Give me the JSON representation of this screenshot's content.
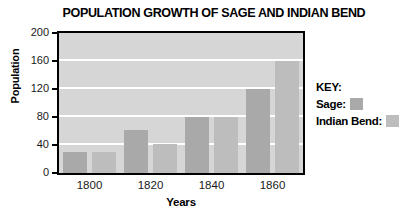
{
  "chart_data": {
    "type": "bar",
    "title": "POPULATION GROWTH OF SAGE AND INDIAN BEND",
    "xlabel": "Years",
    "ylabel": "Population",
    "categories": [
      "1800",
      "1820",
      "1840",
      "1860"
    ],
    "series": [
      {
        "name": "Sage",
        "values": [
          30,
          62,
          80,
          120
        ],
        "color": "#a9a9a9"
      },
      {
        "name": "Indian Bend",
        "values": [
          30,
          41,
          80,
          160
        ],
        "color": "#bdbdbd"
      }
    ],
    "ylim": [
      0,
      200
    ],
    "yticks": [
      0,
      40,
      80,
      120,
      160,
      200
    ],
    "ytick_labels": [
      "0",
      "40",
      "80",
      "120",
      "160",
      "200"
    ],
    "xtick_labels": [
      "1800",
      "1820",
      "1840",
      "1860"
    ],
    "grid": "horizontal-white",
    "legend_position": "right",
    "plot_background": "#d6d6d6"
  },
  "legend": {
    "heading": "KEY:",
    "entries": [
      {
        "label": "Sage:",
        "swatch": "#a9a9a9"
      },
      {
        "label": "Indian Bend:",
        "swatch": "#bdbdbd"
      }
    ]
  }
}
